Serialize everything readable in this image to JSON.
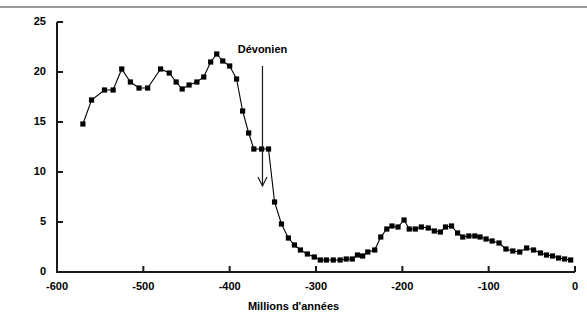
{
  "chart_data": {
    "type": "line",
    "title": "",
    "xlabel": "Millions d'années",
    "ylabel": "RCO2",
    "xlim": [
      -600,
      0
    ],
    "ylim": [
      0,
      25
    ],
    "xticks": [
      -600,
      -500,
      -400,
      -300,
      -200,
      -100,
      0
    ],
    "xtick_labels": [
      "-600",
      "-500",
      "-400",
      "-300",
      "-200",
      "-100",
      "0"
    ],
    "yticks": [
      0,
      5,
      10,
      15,
      20,
      25
    ],
    "ytick_labels": [
      "0",
      "5",
      "10",
      "15",
      "20",
      "25"
    ],
    "grid": false,
    "legend": "none",
    "marker": "square",
    "marker_color": "#000000",
    "line_color": "#000000",
    "annotations": [
      {
        "text": "Dévonien",
        "x": -362,
        "y": 22.1,
        "arrow_from_x": -362,
        "arrow_from_y": 20.6,
        "arrow_to_x": -362,
        "arrow_to_y": 8.6
      }
    ],
    "series": [
      {
        "name": "RCO2",
        "x": [
          -570,
          -560,
          -545,
          -535,
          -525,
          -515,
          -505,
          -495,
          -480,
          -470,
          -462,
          -455,
          -447,
          -438,
          -430,
          -422,
          -415,
          -408,
          -400,
          -392,
          -385,
          -378,
          -372,
          -363,
          -355,
          -348,
          -340,
          -332,
          -325,
          -318,
          -310,
          -302,
          -295,
          -288,
          -280,
          -272,
          -265,
          -258,
          -252,
          -246,
          -240,
          -232,
          -225,
          -218,
          -212,
          -205,
          -198,
          -192,
          -185,
          -178,
          -170,
          -163,
          -156,
          -150,
          -143,
          -136,
          -130,
          -123,
          -116,
          -110,
          -103,
          -96,
          -88,
          -80,
          -72,
          -64,
          -56,
          -48,
          -40,
          -33,
          -26,
          -19,
          -12,
          -5
        ],
        "y": [
          14.8,
          17.2,
          18.2,
          18.2,
          20.3,
          19.0,
          18.4,
          18.4,
          20.3,
          19.9,
          19.0,
          18.3,
          18.7,
          19.0,
          19.5,
          21.0,
          21.8,
          21.1,
          20.6,
          19.3,
          16.1,
          13.9,
          12.3,
          12.3,
          12.3,
          7.0,
          4.8,
          3.4,
          2.7,
          2.2,
          1.8,
          1.5,
          1.2,
          1.2,
          1.2,
          1.2,
          1.3,
          1.3,
          1.7,
          1.6,
          2.0,
          2.2,
          3.5,
          4.3,
          4.6,
          4.5,
          5.2,
          4.3,
          4.3,
          4.5,
          4.4,
          4.1,
          4.0,
          4.5,
          4.6,
          3.9,
          3.5,
          3.6,
          3.6,
          3.5,
          3.3,
          3.1,
          2.9,
          2.3,
          2.1,
          2.0,
          2.4,
          2.2,
          1.9,
          1.7,
          1.6,
          1.4,
          1.3,
          1.2
        ]
      }
    ]
  }
}
